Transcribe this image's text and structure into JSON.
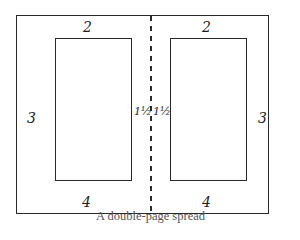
{
  "diagram": {
    "title": "A double-page spread",
    "colors": {
      "line": "#2a2a2a",
      "text": "#1e1e1e",
      "caption": "#555555",
      "background": "#ffffff"
    },
    "left_page": {
      "top_margin": "2",
      "outer_margin": "3",
      "inner_margin": "1½",
      "bottom_margin": "4"
    },
    "right_page": {
      "top_margin": "2",
      "outer_margin": "3",
      "inner_margin": "1½",
      "bottom_margin": "4"
    },
    "gutter_style": "dashed"
  }
}
